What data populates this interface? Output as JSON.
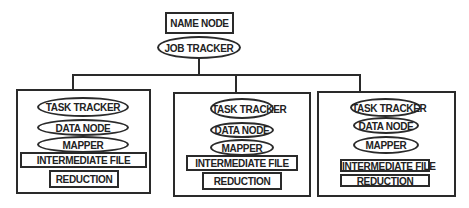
{
  "diagram": {
    "title_node": {
      "label": "NAME NODE"
    },
    "job_tracker": {
      "label": "JOB TRACKER"
    },
    "worker_nodes": [
      {
        "task_tracker": "TASK TRACKER",
        "data_node": "DATA NODE",
        "mapper": "MAPPER",
        "intermediate_file": "INTERMEDIATE FILE",
        "reduction": "REDUCTION"
      },
      {
        "task_tracker": "TASK TRACKER",
        "data_node": "DATA NODE",
        "mapper": "MAPPER",
        "intermediate_file": "INTERMEDIATE FILE",
        "reduction": "REDUCTION"
      },
      {
        "task_tracker": "TASK TRACKER",
        "data_node": "DATA NODE",
        "mapper": "MAPPER",
        "intermediate_file": "INTERMEDIATE FILE",
        "reduction": "REDUCTION"
      }
    ],
    "colors": {
      "stroke": "#2a2a2a",
      "background": "#ffffff",
      "text": "#222222"
    }
  }
}
